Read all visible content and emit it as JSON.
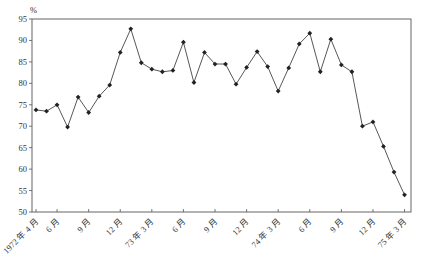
{
  "chart_data": {
    "type": "line",
    "title": "",
    "xlabel": "",
    "ylabel": "%",
    "ylim": [
      50,
      95
    ],
    "yticks": [
      50,
      55,
      60,
      65,
      70,
      75,
      80,
      85,
      90,
      95
    ],
    "grid": false,
    "legend": null,
    "x_tick_labels": [
      "1972 年 4 月",
      "6 月",
      "9 月",
      "12 月",
      "73 年 3 月",
      "6 月",
      "9 月",
      "12 月",
      "74 年 3 月",
      "6 月",
      "9 月",
      "12 月",
      "75 年 3 月"
    ],
    "x_tick_month_index": [
      0,
      2,
      5,
      8,
      11,
      14,
      17,
      20,
      23,
      26,
      29,
      32,
      35
    ],
    "x": [
      "1972-04",
      "1972-05",
      "1972-06",
      "1972-07",
      "1972-08",
      "1972-09",
      "1972-10",
      "1972-11",
      "1972-12",
      "1973-01",
      "1973-02",
      "1973-03",
      "1973-04",
      "1973-05",
      "1973-06",
      "1973-07",
      "1973-08",
      "1973-09",
      "1973-10",
      "1973-11",
      "1973-12",
      "1974-01",
      "1974-02",
      "1974-03",
      "1974-04",
      "1974-05",
      "1974-06",
      "1974-07",
      "1974-08",
      "1974-09",
      "1974-10",
      "1974-11",
      "1974-12",
      "1975-01",
      "1975-02",
      "1975-03"
    ],
    "series": [
      {
        "name": "",
        "marker": "diamond",
        "color": "#222222",
        "values": [
          73.8,
          73.5,
          75.0,
          69.8,
          76.8,
          73.2,
          77.0,
          79.6,
          87.2,
          92.7,
          84.8,
          83.3,
          82.7,
          83.0,
          89.6,
          80.2,
          87.2,
          84.5,
          84.5,
          79.8,
          83.7,
          87.4,
          83.9,
          78.2,
          83.6,
          89.2,
          91.7,
          82.7,
          90.3,
          84.3,
          82.7,
          70.0,
          71.0,
          65.3,
          59.3,
          54.0
        ]
      }
    ]
  }
}
